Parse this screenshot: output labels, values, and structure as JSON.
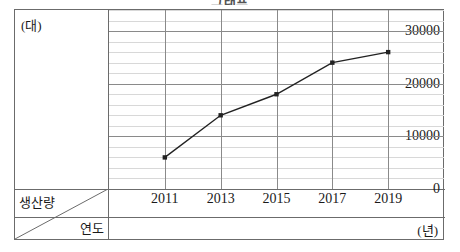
{
  "title": "그래프",
  "axes": {
    "y_unit": "(대)",
    "x_unit": "(년)",
    "corner_top_label": "생산량",
    "corner_bottom_label": "연도"
  },
  "chart_data": {
    "type": "line",
    "title": "그래프",
    "xlabel": "연도",
    "ylabel": "생산량",
    "x_unit": "(년)",
    "y_unit": "(대)",
    "categories": [
      "2011",
      "2013",
      "2015",
      "2017",
      "2019"
    ],
    "values": [
      6000,
      14000,
      18000,
      24000,
      26000
    ],
    "series": [
      {
        "name": "생산량",
        "values": [
          6000,
          14000,
          18000,
          24000,
          26000
        ]
      }
    ],
    "ylim": [
      0,
      34000
    ],
    "ytick_labels": [
      "0",
      "10000",
      "20000",
      "30000"
    ],
    "ytick_values": [
      0,
      10000,
      20000,
      30000
    ],
    "y_minor_step": 2000,
    "xtick_labels": [
      "2011",
      "2013",
      "2015",
      "2017",
      "2019"
    ],
    "grid": true,
    "legend": "none",
    "marker": "square",
    "line_color": "#222222",
    "major_grid_color": "#8a8a8a",
    "minor_grid_color": "#d8d8d8",
    "frame_color": "#6b6b6b"
  }
}
